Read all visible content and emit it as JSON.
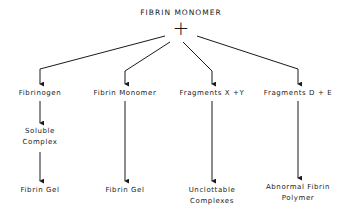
{
  "diagram": {
    "root": {
      "label": "FIBRIN MONOMER",
      "operator": "+"
    },
    "branches": [
      {
        "label": "Fibrinogen",
        "steps": [
          "Soluble Complex",
          "Fibrin Gel"
        ]
      },
      {
        "label": "Fibrin Monomer",
        "steps": [
          "Fibrin Gel"
        ]
      },
      {
        "label": "Fragments X + Y",
        "steps": [
          "Unclottable Complexes"
        ]
      },
      {
        "label": "Fragments D + E",
        "steps": [
          "Abnormal Fibrin Polymer"
        ]
      }
    ],
    "text": {
      "root": "FIBRIN MONOMER",
      "plus": "+",
      "b1": "Fibrinogen",
      "b1_s1_l1": "Soluble",
      "b1_s1_l2": "Complex",
      "b1_s2": "Fibrin Gel",
      "b2": "Fibrin Monomer",
      "b2_s1": "Fibrin Gel",
      "b3": "Fragments X +Y",
      "b3_s1_l1": "Unclottable",
      "b3_s1_l2": "Complexes",
      "b4": "Fragments D + E",
      "b4_s1_l1": "Abnormal Fibrin",
      "b4_s1_l2": "Polymer"
    },
    "colors": {
      "line": "#1a1a1a",
      "background": "#ffffff"
    }
  }
}
